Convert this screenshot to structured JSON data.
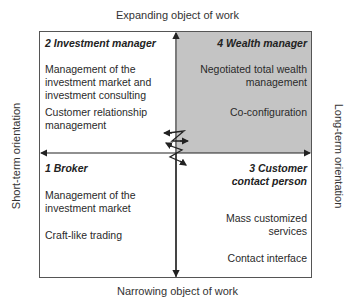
{
  "axes": {
    "top": "Expanding object of work",
    "bottom": "Narrowing object of work",
    "left": "Short-term orientation",
    "right": "Long-term orientation"
  },
  "quadrants": {
    "top_left": {
      "title": "2 Investment manager",
      "items": [
        "Management of the investment market and investment consulting",
        "Customer relationship management"
      ]
    },
    "top_right": {
      "title": "4 Wealth manager",
      "items": [
        "Negotiated total wealth management",
        "Co-configuration"
      ],
      "fill_color": "#c4c4c4"
    },
    "bottom_left": {
      "title": "1 Broker",
      "items": [
        "Management of the investment market",
        "Craft-like trading"
      ]
    },
    "bottom_right": {
      "title": "3 Customer contact person",
      "items": [
        "Mass customized services",
        "Contact interface"
      ]
    }
  },
  "lines": {
    "q2_item1_lines": [
      "Management of the",
      "investment market and",
      "investment consulting"
    ],
    "q2_item2_lines": [
      "Customer relationship",
      "management"
    ],
    "q4_item1_lines": [
      "Negotiated total wealth",
      "management"
    ],
    "q1_item1_lines": [
      "Management of the",
      "investment market"
    ],
    "q3_title_lines": [
      "3 Customer",
      "contact person"
    ],
    "q3_item1_lines": [
      "Mass customized",
      "services"
    ]
  }
}
